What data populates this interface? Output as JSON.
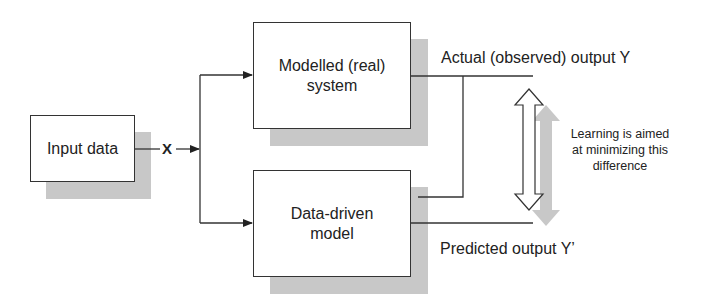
{
  "diagram": {
    "nodes": {
      "input": {
        "label": "Input data"
      },
      "real_system": {
        "label_line1": "Modelled (real)",
        "label_line2": "system"
      },
      "model": {
        "label_line1": "Data-driven",
        "label_line2": "model"
      }
    },
    "signals": {
      "x": "X",
      "actual": "Actual (observed) output Y",
      "predicted": "Predicted output Y’"
    },
    "note": {
      "line1": "Learning is aimed",
      "line2": "at minimizing this",
      "line3": "difference"
    },
    "colors": {
      "stroke": "#333333",
      "shadow": "#c8c8c8",
      "background": "#ffffff"
    }
  }
}
